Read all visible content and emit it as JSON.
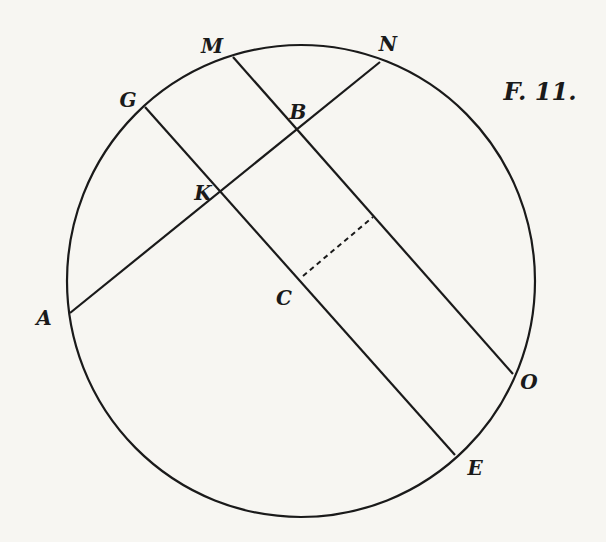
{
  "figure": {
    "title": "F. 11.",
    "stroke_color": "#1a1a1a",
    "background": "#f7f6f2",
    "circle": {
      "cx": 301,
      "cy": 281,
      "rx": 234,
      "ry": 236
    },
    "points": {
      "M": {
        "label": "M",
        "x": 233,
        "y": 57,
        "label_x": 212,
        "label_y": 46
      },
      "N": {
        "label": "N",
        "x": 380,
        "y": 62,
        "label_x": 388,
        "label_y": 44
      },
      "G": {
        "label": "G",
        "x": 145,
        "y": 107,
        "label_x": 128,
        "label_y": 100
      },
      "B": {
        "label": "B",
        "x": 300,
        "y": 128,
        "label_x": 298,
        "label_y": 112
      },
      "K": {
        "label": "K",
        "x": 222,
        "y": 194,
        "label_x": 203,
        "label_y": 193
      },
      "A": {
        "label": "A",
        "x": 70,
        "y": 313,
        "label_x": 44,
        "label_y": 318
      },
      "C": {
        "label": "C",
        "x": 300,
        "y": 281,
        "label_x": 284,
        "label_y": 298
      },
      "O": {
        "label": "O",
        "x": 513,
        "y": 374,
        "label_x": 529,
        "label_y": 382
      },
      "E": {
        "label": "E",
        "x": 455,
        "y": 455,
        "label_x": 475,
        "label_y": 468
      }
    },
    "segments": [
      {
        "name": "chord-AN",
        "from": "A",
        "to": "N",
        "style": "solid"
      },
      {
        "name": "chord-GE",
        "from": "G",
        "to": "E",
        "style": "solid"
      },
      {
        "name": "chord-MO",
        "from": "M",
        "to": "O",
        "style": "solid"
      },
      {
        "name": "perpendicular-from-C",
        "x1": 303,
        "y1": 276,
        "x2": 373,
        "y2": 217,
        "style": "dashed"
      }
    ],
    "title_pos": {
      "x": 540,
      "y": 92
    }
  }
}
